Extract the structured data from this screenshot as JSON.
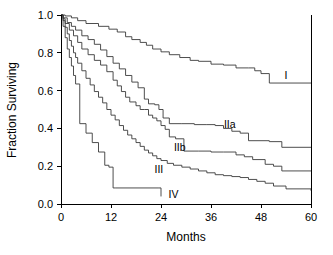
{
  "chart_data": {
    "type": "line",
    "title": "",
    "subtitle": "",
    "xlabel": "Months",
    "ylabel": "Fraction Surviving",
    "xlim": [
      0,
      60
    ],
    "ylim": [
      0.0,
      1.0
    ],
    "xticks": [
      0,
      12,
      24,
      36,
      48,
      60
    ],
    "xtick_labels": [
      "0",
      "12",
      "24",
      "36",
      "48",
      "60"
    ],
    "yticks": [
      0.0,
      0.2,
      0.4,
      0.6,
      0.8,
      1.0
    ],
    "ytick_labels": [
      "0.0",
      "0.2",
      "0.4",
      "0.6",
      "0.8",
      "1.0"
    ],
    "grid": false,
    "legend_position": "inline-right-of-curves",
    "step_type": "post",
    "line_color": "#3a3a3a",
    "axis_color": "#000000",
    "background_color": "#ffffff",
    "series": [
      {
        "name": "I",
        "label": "I",
        "label_x": 54.0,
        "label_y": 0.685,
        "x": [
          0,
          1,
          2.5,
          4,
          6,
          9,
          11.5,
          13.5,
          15.5,
          17,
          19,
          20.5,
          22,
          24,
          26,
          28.5,
          31,
          33,
          36,
          39,
          42,
          45,
          46.5,
          48,
          50,
          60
        ],
        "y": [
          1.0,
          0.995,
          0.985,
          0.97,
          0.955,
          0.94,
          0.925,
          0.91,
          0.885,
          0.87,
          0.855,
          0.84,
          0.82,
          0.805,
          0.79,
          0.775,
          0.76,
          0.755,
          0.74,
          0.735,
          0.72,
          0.72,
          0.705,
          0.69,
          0.64,
          0.64
        ]
      },
      {
        "name": "IIa",
        "label": "IIa",
        "label_x": 40.5,
        "label_y": 0.425,
        "x": [
          0,
          0.5,
          1.5,
          2.5,
          3.5,
          5,
          6.5,
          8,
          9.5,
          11,
          12.5,
          14,
          15.5,
          17,
          18.5,
          20,
          21,
          22.5,
          23.5,
          24.5,
          26,
          29,
          32,
          35,
          37,
          39,
          41,
          43,
          45,
          50,
          53,
          60
        ],
        "y": [
          1.0,
          0.985,
          0.96,
          0.94,
          0.92,
          0.89,
          0.87,
          0.845,
          0.815,
          0.78,
          0.745,
          0.715,
          0.68,
          0.645,
          0.615,
          0.555,
          0.53,
          0.525,
          0.5,
          0.455,
          0.425,
          0.425,
          0.42,
          0.42,
          0.415,
          0.4,
          0.385,
          0.375,
          0.335,
          0.33,
          0.3,
          0.3
        ]
      },
      {
        "name": "IIb",
        "label": "IIb",
        "label_x": 28.5,
        "label_y": 0.3,
        "x": [
          0,
          0.5,
          1,
          2,
          3,
          4,
          5,
          6.5,
          8,
          9.5,
          11,
          12.5,
          13.5,
          14.5,
          15.5,
          16.5,
          18,
          19,
          20,
          21,
          22,
          23,
          24,
          25,
          26,
          27.5,
          29.5,
          33,
          36,
          39,
          42,
          44,
          46,
          49,
          51,
          53,
          60
        ],
        "y": [
          1.0,
          0.98,
          0.955,
          0.92,
          0.89,
          0.855,
          0.82,
          0.79,
          0.76,
          0.735,
          0.7,
          0.655,
          0.625,
          0.595,
          0.565,
          0.54,
          0.52,
          0.5,
          0.5,
          0.47,
          0.455,
          0.44,
          0.415,
          0.395,
          0.355,
          0.345,
          0.28,
          0.28,
          0.275,
          0.275,
          0.26,
          0.25,
          0.235,
          0.21,
          0.2,
          0.175,
          0.175
        ]
      },
      {
        "name": "III",
        "label": "III",
        "label_x": 23.5,
        "label_y": 0.185,
        "x": [
          0,
          0.5,
          1,
          1.5,
          2,
          2.5,
          3,
          3.5,
          4,
          5,
          6,
          7,
          8,
          9,
          10,
          11,
          12,
          13,
          14,
          15,
          16,
          17,
          18,
          19,
          20,
          21,
          22,
          23,
          24,
          25.5,
          27,
          29,
          31,
          33,
          35,
          37,
          39,
          41,
          43,
          45,
          47,
          49,
          51,
          54,
          60
        ],
        "y": [
          1.0,
          0.97,
          0.935,
          0.9,
          0.865,
          0.835,
          0.8,
          0.775,
          0.745,
          0.705,
          0.665,
          0.63,
          0.595,
          0.565,
          0.535,
          0.5,
          0.47,
          0.445,
          0.415,
          0.39,
          0.365,
          0.345,
          0.325,
          0.305,
          0.285,
          0.27,
          0.255,
          0.24,
          0.23,
          0.215,
          0.205,
          0.195,
          0.185,
          0.175,
          0.165,
          0.155,
          0.15,
          0.145,
          0.14,
          0.13,
          0.12,
          0.11,
          0.095,
          0.08,
          0.07
        ]
      },
      {
        "name": "IV",
        "label": "IV",
        "label_x": 27.0,
        "label_y": 0.055,
        "x": [
          0,
          0.5,
          1,
          1.5,
          2,
          2.5,
          3,
          3.5,
          4.5,
          6,
          7.5,
          9,
          10.5,
          11.5,
          12.5,
          13,
          23.5,
          24
        ],
        "y": [
          1.0,
          0.94,
          0.88,
          0.82,
          0.775,
          0.73,
          0.68,
          0.635,
          0.425,
          0.375,
          0.325,
          0.275,
          0.205,
          0.195,
          0.085,
          0.085,
          0.085,
          0.04
        ]
      }
    ]
  }
}
